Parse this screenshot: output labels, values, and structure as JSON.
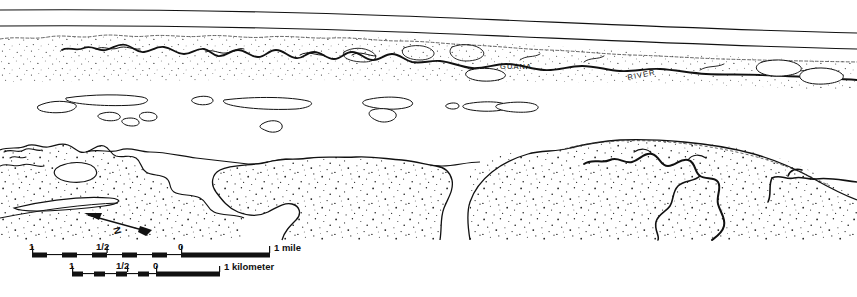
{
  "figure": {
    "kind": "line-drawing-map",
    "width": 857,
    "height": 297,
    "background_color": "#ffffff",
    "ink_color": "#111111"
  },
  "labels": {
    "river_name_part1": "GUANA",
    "river_name_part2": "RIVER"
  },
  "north_arrow": {
    "letter": "N"
  },
  "scale_bars": [
    {
      "id": "miles",
      "unit_label": "1 mile",
      "ticks": [
        "1",
        "1/2",
        "0"
      ],
      "end_label": "1 mile"
    },
    {
      "id": "kilometers",
      "unit_label": "1 kilometer",
      "ticks": [
        "1",
        "1/2",
        "0"
      ],
      "end_label": "1 kilometer"
    }
  ]
}
